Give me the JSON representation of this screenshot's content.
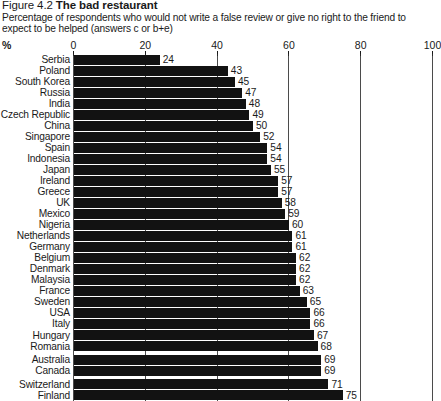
{
  "figure": {
    "number": "Figure 4.2",
    "name": "The bad restaurant",
    "subtitle": "Percentage of respondents who would not write a false review or give no right to the friend to expect to be helped (answers c or b+e)",
    "unit_label": "%"
  },
  "chart_data": {
    "type": "bar",
    "orientation": "horizontal",
    "title": "The bad restaurant",
    "subtitle": "Percentage of respondents who would not write a false review or give no right to the friend to expect to be helped (answers c or b+e)",
    "xlabel": "%",
    "ylabel": "",
    "xlim": [
      0,
      100
    ],
    "xticks": [
      0,
      20,
      40,
      60,
      80,
      100
    ],
    "xticklabels": [
      "0",
      "20",
      "40",
      "60",
      "80",
      "100"
    ],
    "grid": true,
    "grid_axis": "x",
    "legend": false,
    "bar_color": "#121212",
    "value_labels": true,
    "categories": [
      "Serbia",
      "Poland",
      "South Korea",
      "Russia",
      "India",
      "Czech Republic",
      "China",
      "Singapore",
      "Spain",
      "Indonesia",
      "Japan",
      "Ireland",
      "Greece",
      "UK",
      "Mexico",
      "Nigeria",
      "Netherlands",
      "Germany",
      "Belgium",
      "Denmark",
      "Malaysia",
      "France",
      "Sweden",
      "USA",
      "Italy",
      "Hungary",
      "Romania",
      "Australia",
      "Canada",
      "Switzerland",
      "Finland"
    ],
    "values": [
      24,
      43,
      45,
      47,
      48,
      49,
      50,
      52,
      54,
      54,
      55,
      57,
      57,
      58,
      59,
      60,
      61,
      61,
      62,
      62,
      62,
      63,
      65,
      66,
      66,
      67,
      68,
      69,
      69,
      71,
      75
    ]
  }
}
